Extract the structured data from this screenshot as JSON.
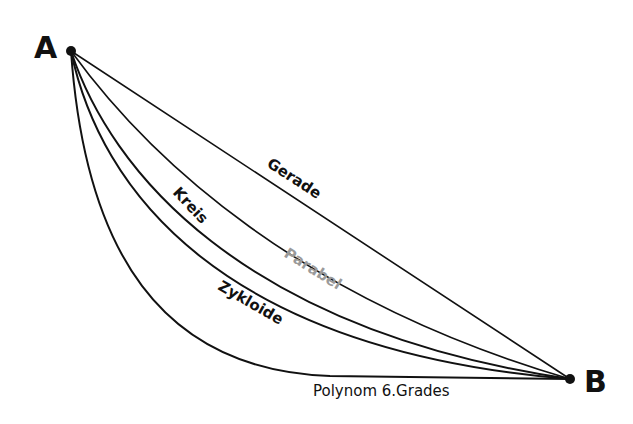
{
  "diagram": {
    "type": "brachistochrone-curve-comparison",
    "points": {
      "start": {
        "label": "A",
        "x": 71,
        "y": 51
      },
      "end": {
        "label": "B",
        "x": 570,
        "y": 379
      }
    },
    "curves": [
      {
        "id": "gerade",
        "label": "Gerade",
        "color": "#111111"
      },
      {
        "id": "parabel",
        "label": "Parabel",
        "color": "#9a9a9a"
      },
      {
        "id": "kreis",
        "label": "Kreis",
        "color": "#111111"
      },
      {
        "id": "zykloide",
        "label": "Zykloide",
        "color": "#111111"
      },
      {
        "id": "polynom",
        "label": "Polynom 6.Grades",
        "color": "#111111"
      }
    ]
  }
}
